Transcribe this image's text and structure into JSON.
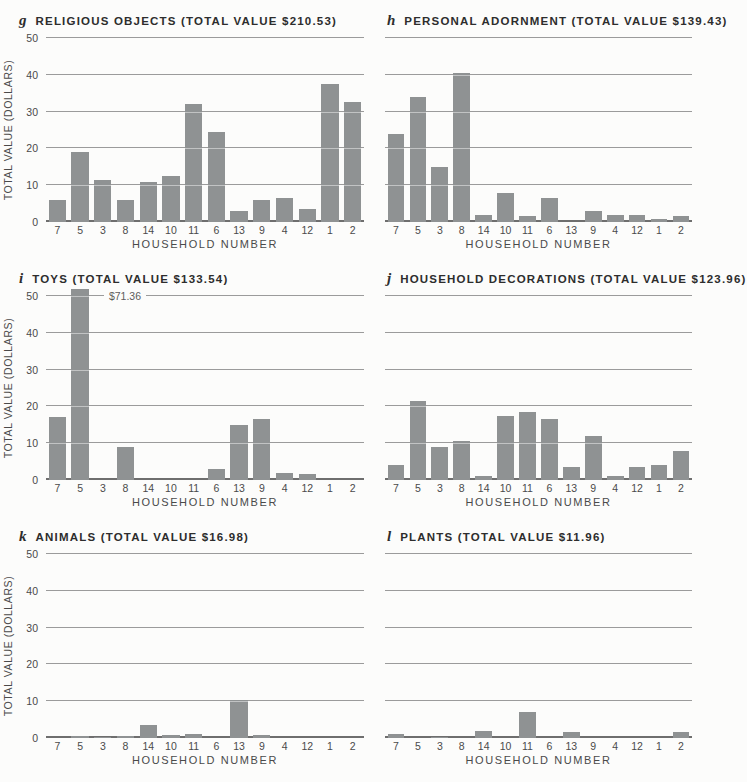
{
  "page": {
    "background": "#fcfcfb"
  },
  "colors": {
    "bar": "#8f9293",
    "gridline": "#9b9b9b",
    "baseline": "#6e6e6e",
    "title_text": "#2d2d2d",
    "tick_text": "#4a4a4a"
  },
  "chart_data": {
    "type": "bar",
    "layout": "2-column 3-row grid of small multiples",
    "xlabel": "HOUSEHOLD NUMBER",
    "ylabel": "TOTAL VALUE (DOLLARS)",
    "ylim": [
      0,
      50
    ],
    "yticks": [
      50,
      40,
      30,
      20,
      10,
      0
    ],
    "grid": "horizontal gridlines every 10 dollars",
    "categories": [
      "7",
      "5",
      "3",
      "8",
      "14",
      "10",
      "11",
      "6",
      "13",
      "9",
      "4",
      "12",
      "1",
      "2"
    ],
    "charts": [
      {
        "letter": "g",
        "title": "RELIGIOUS OBJECTS (TOTAL VALUE $210.53)",
        "total_value": "$210.53",
        "values": [
          6,
          19,
          11.5,
          6,
          11,
          12.5,
          32,
          24.5,
          3,
          6,
          6.5,
          3.5,
          37.5,
          32.5
        ]
      },
      {
        "letter": "h",
        "title": "PERSONAL ADORNMENT (TOTAL VALUE $139.43)",
        "total_value": "$139.43",
        "values": [
          24,
          34,
          15,
          40.5,
          2,
          8,
          1.5,
          6.5,
          0,
          3,
          2,
          2,
          0.7,
          1.7
        ]
      },
      {
        "letter": "i",
        "title": "TOYS (TOTAL VALUE $133.54)",
        "total_value": "$133.54",
        "values": [
          17,
          71.36,
          0,
          9,
          0,
          0,
          0,
          3,
          15,
          16.5,
          1.8,
          1.5,
          0,
          0
        ],
        "bar_display_cap": 52,
        "annotation": {
          "category": "5",
          "text": "$71.36"
        }
      },
      {
        "letter": "j",
        "title": "HOUSEHOLD DECORATIONS (TOTAL VALUE $123.96)",
        "total_value": "$123.96",
        "values": [
          4,
          21.5,
          9,
          10.5,
          1,
          17.5,
          18.5,
          16.5,
          3.5,
          12,
          1,
          3.5,
          4,
          8
        ]
      },
      {
        "letter": "k",
        "title": "ANIMALS (TOTAL VALUE $16.98)",
        "total_value": "$16.98",
        "values": [
          0,
          0.6,
          0.3,
          0.6,
          3.5,
          0.9,
          1.1,
          0,
          10.2,
          0.8,
          0,
          0,
          0,
          0
        ]
      },
      {
        "letter": "l",
        "title": "PLANTS (TOTAL VALUE $11.96)",
        "total_value": "$11.96",
        "values": [
          1,
          0,
          0.3,
          0,
          1.8,
          0,
          7,
          0,
          1.6,
          0,
          0,
          0,
          0,
          1.5
        ]
      }
    ]
  }
}
